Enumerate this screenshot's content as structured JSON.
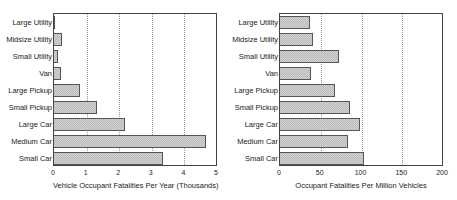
{
  "chart_data": [
    {
      "type": "bar",
      "orientation": "horizontal",
      "title": "",
      "categories": [
        "Large Utility",
        "Midsize Utility",
        "Small Utility",
        "Van",
        "Large Pickup",
        "Small Pickup",
        "Large Car",
        "Medium Car",
        "Small Car"
      ],
      "values": [
        0.03,
        0.25,
        0.13,
        0.21,
        0.79,
        1.32,
        2.18,
        4.66,
        3.34
      ],
      "xlabel": "Vehicle Occupant Fatalities Per Year (Thousands)",
      "ylabel": "",
      "xlim": [
        0,
        5
      ],
      "xticks": [
        "0",
        "1",
        "2",
        "3",
        "4",
        "5"
      ],
      "grid": "vertical dotted",
      "legend": "none"
    },
    {
      "type": "bar",
      "orientation": "horizontal",
      "title": "",
      "categories": [
        "Large Utility",
        "Midsize Utility",
        "Small Utility",
        "Van",
        "Large Pickup",
        "Small Pickup",
        "Large Car",
        "Medium Car",
        "Small Car"
      ],
      "values": [
        37,
        40,
        72,
        38,
        67,
        86,
        98,
        84,
        103
      ],
      "xlabel": "Occupant Fatalities Per Million Vehicles",
      "ylabel": "",
      "xlim": [
        0,
        200
      ],
      "xticks": [
        "0",
        "50",
        "100",
        "150",
        "200"
      ],
      "grid": "vertical dotted",
      "legend": "none"
    }
  ]
}
